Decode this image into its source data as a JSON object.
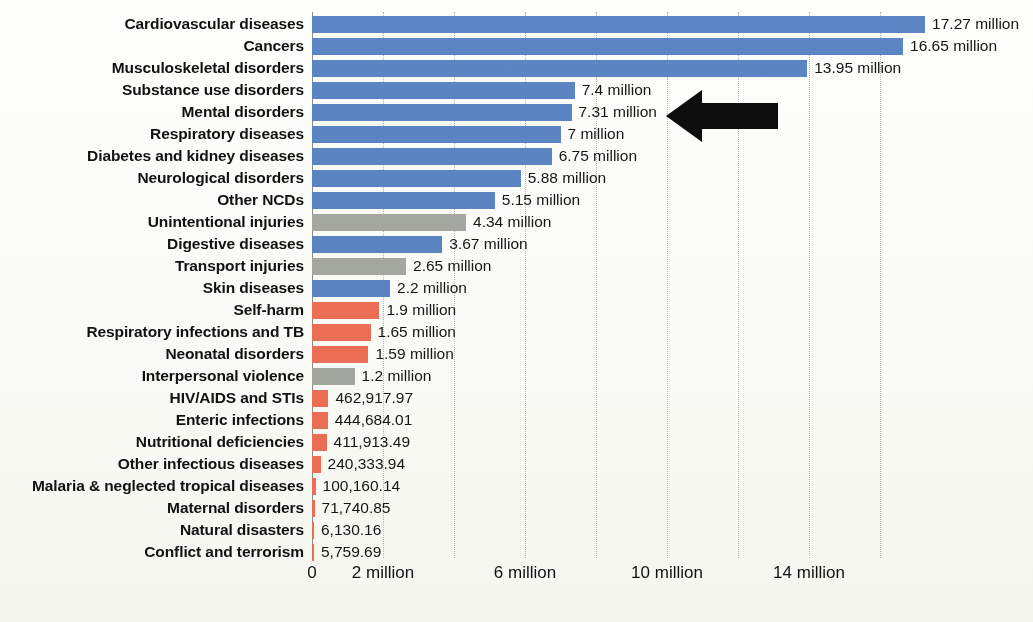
{
  "chart_data": {
    "type": "bar",
    "orientation": "horizontal",
    "title": "",
    "subtitle": "",
    "xlabel": "",
    "ylabel": "",
    "xlim": [
      0,
      17.6
    ],
    "grid": true,
    "grid_axis": "x",
    "legend": "none",
    "units": "deaths",
    "axis": {
      "tick_values": [
        0,
        2,
        6,
        10,
        14
      ],
      "tick_labels": [
        "0",
        "2 million",
        "6 million",
        "10 million",
        "14 million"
      ]
    },
    "categories": [
      "Cardiovascular diseases",
      "Cancers",
      "Musculoskeletal disorders",
      "Substance use disorders",
      "Mental disorders",
      "Respiratory diseases",
      "Diabetes and kidney diseases",
      "Neurological disorders",
      "Other NCDs",
      "Unintentional injuries",
      "Digestive diseases",
      "Transport injuries",
      "Skin diseases",
      "Self-harm",
      "Respiratory infections and TB",
      "Neonatal disorders",
      "Interpersonal violence",
      "HIV/AIDS and STIs",
      "Enteric infections",
      "Nutritional deficiencies",
      "Other infectious diseases",
      "Malaria & neglected tropical diseases",
      "Maternal disorders",
      "Natural disasters",
      "Conflict and terrorism"
    ],
    "values": [
      17270000,
      16650000,
      13950000,
      7400000,
      7310000,
      7000000,
      6750000,
      5880000,
      5150000,
      4340000,
      3670000,
      2650000,
      2200000,
      1900000,
      1650000,
      1590000,
      1200000,
      462917.97,
      444684.01,
      411913.49,
      240333.94,
      100160.14,
      71740.85,
      6130.16,
      5759.69
    ],
    "value_labels": [
      "17.27 million",
      "16.65 million",
      "13.95 million",
      "7.4 million",
      "7.31 million",
      "7 million",
      "6.75 million",
      "5.88 million",
      "5.15 million",
      "4.34 million",
      "3.67 million",
      "2.65 million",
      "2.2 million",
      "1.9 million",
      "1.65 million",
      "1.59 million",
      "1.2 million",
      "462,917.97",
      "444,684.01",
      "411,913.49",
      "240,333.94",
      "100,160.14",
      "71,740.85",
      "6,130.16",
      "5,759.69"
    ],
    "bar_colors": [
      "blue",
      "blue",
      "blue",
      "blue",
      "blue",
      "blue",
      "blue",
      "blue",
      "blue",
      "gray",
      "blue",
      "gray",
      "blue",
      "orange",
      "orange",
      "orange",
      "gray",
      "orange",
      "orange",
      "orange",
      "orange",
      "orange",
      "orange",
      "orange",
      "orange"
    ],
    "color_map": {
      "blue": "#5b85c4",
      "gray": "#a6a8a3",
      "orange": "#ee7055"
    }
  },
  "annotations": {
    "arrow": {
      "name": "black-left-arrow",
      "points_to": "Mental disorders",
      "color": "#0d0d0d",
      "direction": "left"
    }
  }
}
